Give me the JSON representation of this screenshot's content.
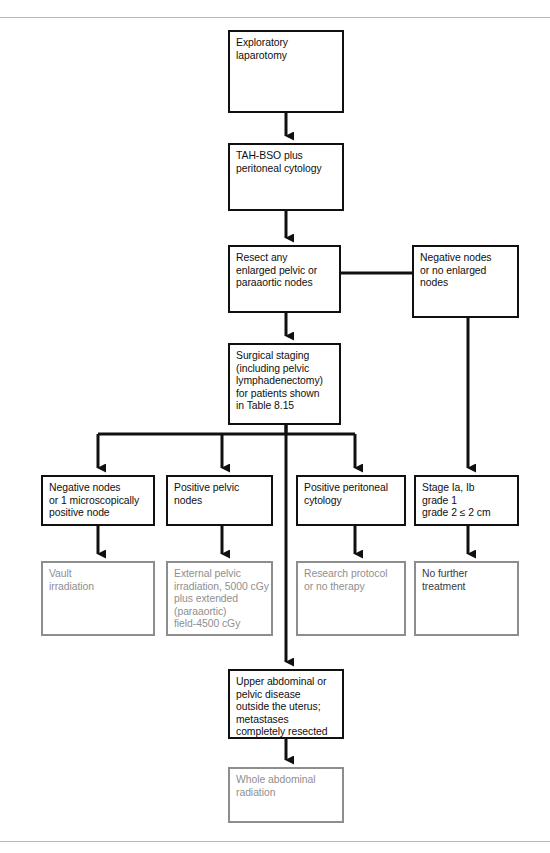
{
  "figure": {
    "kind": "clinical-management-flowchart",
    "topic": "Surgical staging and treatment of endometrial carcinoma",
    "rules": {
      "top": "horizontal-rule",
      "bottom": "horizontal-rule"
    }
  },
  "colors": {
    "primary_border": "#101010",
    "primary_text": "#101010",
    "secondary_border": "#8d8d8d",
    "secondary_text": "#8f8f8f",
    "rule": "#b9b9b9",
    "background": "#ffffff"
  },
  "nodes": {
    "exploratory_laparotomy": {
      "lines": [
        "Exploratory",
        "laparotomy"
      ],
      "style": "dark"
    },
    "tah_bso": {
      "lines": [
        "TAH-BSO plus",
        "peritoneal cytology"
      ],
      "style": "dark"
    },
    "resect_nodes": {
      "lines": [
        "Resect any",
        "enlarged pelvic or",
        "paraaortic nodes"
      ],
      "style": "dark"
    },
    "negative_no_enlarged": {
      "lines": [
        "Negative nodes",
        "or no enlarged",
        "nodes"
      ],
      "style": "dark"
    },
    "surgical_staging": {
      "lines": [
        "Surgical staging",
        "(including pelvic",
        "lymphadenectomy)",
        "for patients shown",
        "in Table 8.15"
      ],
      "style": "dark"
    },
    "negative_nodes_micro": {
      "lines": [
        "Negative nodes",
        "or 1 microscopically",
        "positive node"
      ],
      "style": "dark"
    },
    "positive_pelvic_nodes": {
      "lines": [
        "Positive pelvic",
        "nodes"
      ],
      "style": "dark"
    },
    "positive_peritoneal_cytology": {
      "lines": [
        "Positive peritoneal",
        "cytology"
      ],
      "style": "dark"
    },
    "stage_ia_ib": {
      "lines": [
        "Stage Ia, Ib",
        "grade 1",
        "grade 2 ≤ 2 cm"
      ],
      "style": "dark"
    },
    "vault_irradiation": {
      "lines": [
        "Vault",
        "irradiation"
      ],
      "style": "gray"
    },
    "external_pelvic_irradiation": {
      "lines": [
        "External pelvic",
        "irradiation, 5000 cGy",
        "plus extended",
        "(paraaortic)",
        "field-4500 cGy"
      ],
      "style": "gray"
    },
    "research_protocol": {
      "lines": [
        "Research protocol",
        "or no therapy"
      ],
      "style": "gray"
    },
    "no_further_treatment": {
      "lines": [
        "No further",
        "treatment"
      ],
      "style": "gray-darktext"
    },
    "upper_abdominal_disease": {
      "lines": [
        "Upper abdominal or",
        "pelvic disease",
        "outside the uterus;",
        "metastases",
        "completely resected"
      ],
      "style": "dark"
    },
    "whole_abdominal_radiation": {
      "lines": [
        "Whole abdominal",
        "radiation"
      ],
      "style": "gray"
    }
  },
  "edges": [
    {
      "name": "laparotomy-to-tahbso",
      "from": "exploratory_laparotomy",
      "to": "tah_bso",
      "direction": "down",
      "style": "dark"
    },
    {
      "name": "tahbso-to-resect",
      "from": "tah_bso",
      "to": "resect_nodes",
      "direction": "down",
      "style": "dark"
    },
    {
      "name": "resect-to-negative-no-enlarged",
      "from": "resect_nodes",
      "to": "negative_no_enlarged",
      "direction": "right",
      "style": "dark"
    },
    {
      "name": "resect-to-surgical-staging",
      "from": "resect_nodes",
      "to": "surgical_staging",
      "direction": "down",
      "style": "dark"
    },
    {
      "name": "staging-branch-bus",
      "from": "surgical_staging",
      "to": "branch-row",
      "direction": "down-split",
      "style": "dark"
    },
    {
      "name": "staging-to-upper-abdominal",
      "from": "surgical_staging",
      "to": "upper_abdominal_disease",
      "direction": "down",
      "style": "dark"
    },
    {
      "name": "negative-no-enlarged-to-stage-ia-ib",
      "from": "negative_no_enlarged",
      "to": "stage_ia_ib",
      "direction": "down",
      "style": "dark"
    },
    {
      "name": "negative-micro-to-vault",
      "from": "negative_nodes_micro",
      "to": "vault_irradiation",
      "direction": "down",
      "style": "dark"
    },
    {
      "name": "positive-pelvic-to-external",
      "from": "positive_pelvic_nodes",
      "to": "external_pelvic_irradiation",
      "direction": "down",
      "style": "dark"
    },
    {
      "name": "peritoneal-to-research",
      "from": "positive_peritoneal_cytology",
      "to": "research_protocol",
      "direction": "down",
      "style": "dark"
    },
    {
      "name": "stage-to-no-further",
      "from": "stage_ia_ib",
      "to": "no_further_treatment",
      "direction": "down",
      "style": "dark"
    },
    {
      "name": "upper-abdominal-to-whole-radiation",
      "from": "upper_abdominal_disease",
      "to": "whole_abdominal_radiation",
      "direction": "down",
      "style": "dark"
    }
  ]
}
